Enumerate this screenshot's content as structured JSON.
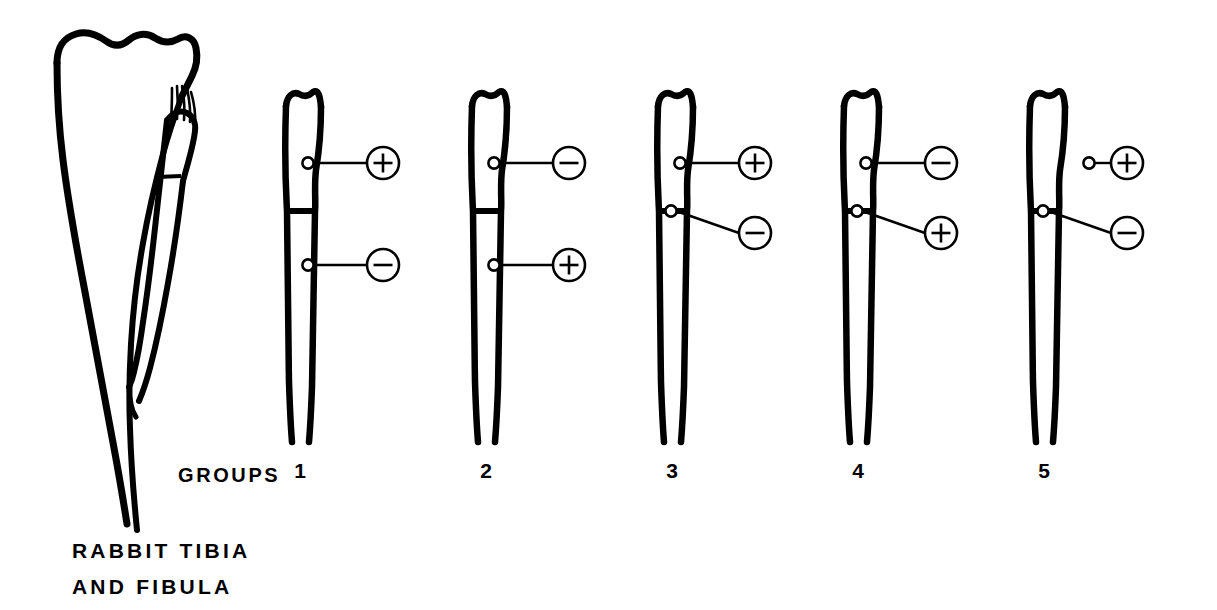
{
  "figure": {
    "caption_line1": "RABBIT TIBIA",
    "caption_line2": "AND FIBULA",
    "groups_label": "GROUPS",
    "background_color": "#ffffff",
    "ink_color": "#000000"
  },
  "anatomy": {
    "name": "rabbit-tibia-and-fibula",
    "parts": [
      "tibia",
      "fibula",
      "interosseous-ligament-hatching",
      "fibular-head"
    ]
  },
  "groups": [
    {
      "number": "1",
      "proximal_electrode": {
        "polarity": "+",
        "polarity_name": "plus",
        "location": "proximal-metaphysis",
        "in_bone": true
      },
      "distal_electrode": {
        "polarity": "−",
        "polarity_name": "minus",
        "location": "distal-shaft",
        "in_bone": true
      },
      "osteotomy": true
    },
    {
      "number": "2",
      "proximal_electrode": {
        "polarity": "−",
        "polarity_name": "minus",
        "location": "proximal-metaphysis",
        "in_bone": true
      },
      "distal_electrode": {
        "polarity": "+",
        "polarity_name": "plus",
        "location": "distal-shaft",
        "in_bone": true
      },
      "osteotomy": true
    },
    {
      "number": "3",
      "proximal_electrode": {
        "polarity": "+",
        "polarity_name": "plus",
        "location": "proximal-metaphysis",
        "in_bone": true
      },
      "distal_electrode": {
        "polarity": "−",
        "polarity_name": "minus",
        "location": "osteotomy-site",
        "in_bone": true
      },
      "osteotomy": true
    },
    {
      "number": "4",
      "proximal_electrode": {
        "polarity": "−",
        "polarity_name": "minus",
        "location": "proximal-metaphysis",
        "in_bone": true
      },
      "distal_electrode": {
        "polarity": "+",
        "polarity_name": "plus",
        "location": "osteotomy-site",
        "in_bone": true
      },
      "osteotomy": true
    },
    {
      "number": "5",
      "proximal_electrode": {
        "polarity": "+",
        "polarity_name": "plus",
        "location": "soft-tissue-outside-bone",
        "in_bone": false
      },
      "distal_electrode": {
        "polarity": "−",
        "polarity_name": "minus",
        "location": "osteotomy-site",
        "in_bone": true
      },
      "osteotomy": true
    }
  ]
}
